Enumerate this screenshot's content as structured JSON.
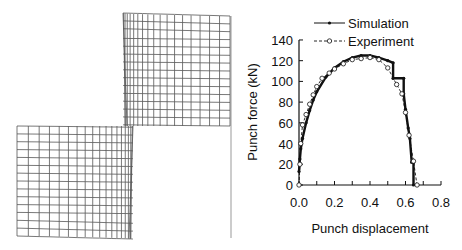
{
  "figure": {
    "left_panel": {
      "description": "Deformed finite element mesh of sheet during punching (two blocks separated by shear zone)",
      "upper_block": {
        "x": 123,
        "y": 16,
        "w": 107,
        "h": 110,
        "cols": 18,
        "rows": 14
      },
      "lower_block": {
        "x": 17,
        "y": 126,
        "w": 116,
        "h": 110,
        "cols": 18,
        "rows": 14
      },
      "divider_line_color": "#bbbbbb",
      "mesh_color": "#555555"
    }
  },
  "chart_data": {
    "type": "line",
    "title": "",
    "xlabel": "Punch displacement",
    "ylabel": "Punch force (kN)",
    "xlim": [
      0.0,
      0.8
    ],
    "ylim": [
      0,
      140
    ],
    "xticks": [
      "0.0",
      "0.2",
      "0.4",
      "0.6",
      "0.8"
    ],
    "yticks": [
      "0",
      "20",
      "40",
      "60",
      "80",
      "100",
      "120",
      "140"
    ],
    "grid": false,
    "legend_position": "top-inside",
    "series": [
      {
        "name": "Simulation",
        "style": "solid line, filled dot markers",
        "color": "#111111",
        "x": [
          0,
          0.005,
          0.01,
          0.02,
          0.04,
          0.06,
          0.08,
          0.1,
          0.15,
          0.2,
          0.25,
          0.3,
          0.35,
          0.4,
          0.45,
          0.5,
          0.53,
          0.53,
          0.59,
          0.59,
          0.6,
          0.615,
          0.625,
          0.635,
          0.645,
          0.645
        ],
        "y": [
          13,
          25,
          35,
          45,
          60,
          72,
          82,
          90,
          104,
          113,
          119,
          123,
          125,
          125,
          123,
          120,
          118,
          103,
          103,
          88,
          73,
          55,
          45,
          22,
          22,
          0
        ]
      },
      {
        "name": "Experiment",
        "style": "dashed line, open circle markers",
        "color": "#111111",
        "x": [
          0,
          0.005,
          0.01,
          0.02,
          0.04,
          0.06,
          0.08,
          0.1,
          0.13,
          0.17,
          0.2,
          0.25,
          0.3,
          0.35,
          0.4,
          0.45,
          0.5,
          0.55,
          0.58,
          0.6,
          0.62,
          0.645,
          0.665
        ],
        "y": [
          0,
          20,
          40,
          58,
          68,
          78,
          87,
          95,
          103,
          108,
          112,
          117,
          121,
          122,
          123,
          121,
          113,
          97,
          88,
          70,
          48,
          23,
          0
        ]
      }
    ]
  }
}
